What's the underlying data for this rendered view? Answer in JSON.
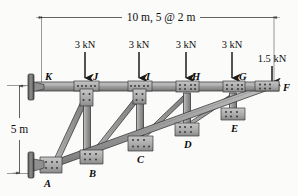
{
  "figure": {
    "type": "truss-free-body-diagram",
    "background_color": "#fbfbfa",
    "member_fill": "#9a9a9a",
    "member_stroke": "#2b2b2b",
    "gusset_fill": "#b5b5b5",
    "support_fill": "#6e6e6e"
  },
  "dimensions": {
    "span": {
      "label": "10 m, 5 @ 2 m",
      "orientation": "horizontal",
      "value_m": 10,
      "panels": 5,
      "panel_length_m": 2
    },
    "height": {
      "label": "5 m",
      "orientation": "vertical",
      "value_m": 5
    }
  },
  "loads": [
    {
      "id": "load-J",
      "label": "3 kN",
      "magnitude_kN": 3,
      "joint": "J",
      "direction": "down"
    },
    {
      "id": "load-I",
      "label": "3 kN",
      "magnitude_kN": 3,
      "joint": "I",
      "direction": "down"
    },
    {
      "id": "load-H",
      "label": "3 kN",
      "magnitude_kN": 3,
      "joint": "H",
      "direction": "down"
    },
    {
      "id": "load-G",
      "label": "3 kN",
      "magnitude_kN": 3,
      "joint": "G",
      "direction": "down"
    },
    {
      "id": "load-F",
      "label": "1.5 kN",
      "magnitude_kN": 1.5,
      "joint": "F",
      "direction": "down"
    }
  ],
  "joints": [
    {
      "id": "K",
      "label": "K",
      "chord": "top",
      "x_m": 0,
      "y_m": 5
    },
    {
      "id": "J",
      "label": "J",
      "chord": "top",
      "x_m": 2,
      "y_m": 5
    },
    {
      "id": "I",
      "label": "I",
      "chord": "top",
      "x_m": 4,
      "y_m": 5
    },
    {
      "id": "H",
      "label": "H",
      "chord": "top",
      "x_m": 6,
      "y_m": 5
    },
    {
      "id": "G",
      "label": "G",
      "chord": "top",
      "x_m": 8,
      "y_m": 5
    },
    {
      "id": "F",
      "label": "F",
      "chord": "apex",
      "x_m": 10,
      "y_m": 5
    },
    {
      "id": "A",
      "label": "A",
      "chord": "bottom",
      "x_m": 0,
      "y_m": 0
    },
    {
      "id": "B",
      "label": "B",
      "chord": "bottom",
      "x_m": 2,
      "y_m": 1
    },
    {
      "id": "C",
      "label": "C",
      "chord": "bottom",
      "x_m": 4,
      "y_m": 2
    },
    {
      "id": "D",
      "label": "D",
      "chord": "bottom",
      "x_m": 6,
      "y_m": 3
    },
    {
      "id": "E",
      "label": "E",
      "chord": "bottom",
      "x_m": 8,
      "y_m": 4
    }
  ],
  "members": [
    {
      "id": "KJ",
      "from": "K",
      "to": "J",
      "type": "top-chord"
    },
    {
      "id": "JI",
      "from": "J",
      "to": "I",
      "type": "top-chord"
    },
    {
      "id": "IH",
      "from": "I",
      "to": "H",
      "type": "top-chord"
    },
    {
      "id": "HG",
      "from": "H",
      "to": "G",
      "type": "top-chord"
    },
    {
      "id": "GF",
      "from": "G",
      "to": "F",
      "type": "top-chord"
    },
    {
      "id": "AB",
      "from": "A",
      "to": "B",
      "type": "bottom-chord"
    },
    {
      "id": "BC",
      "from": "B",
      "to": "C",
      "type": "bottom-chord"
    },
    {
      "id": "CD",
      "from": "C",
      "to": "D",
      "type": "bottom-chord"
    },
    {
      "id": "DE",
      "from": "D",
      "to": "E",
      "type": "bottom-chord"
    },
    {
      "id": "EF",
      "from": "E",
      "to": "F",
      "type": "bottom-chord"
    },
    {
      "id": "JB",
      "from": "J",
      "to": "B",
      "type": "vertical"
    },
    {
      "id": "IC",
      "from": "I",
      "to": "C",
      "type": "vertical"
    },
    {
      "id": "HD",
      "from": "H",
      "to": "D",
      "type": "vertical"
    },
    {
      "id": "GE",
      "from": "G",
      "to": "E",
      "type": "vertical"
    },
    {
      "id": "JA",
      "from": "J",
      "to": "A",
      "type": "diagonal"
    },
    {
      "id": "IB",
      "from": "I",
      "to": "B",
      "type": "diagonal"
    },
    {
      "id": "HC",
      "from": "H",
      "to": "C",
      "type": "diagonal"
    },
    {
      "id": "GD",
      "from": "G",
      "to": "E",
      "type": "diagonal"
    }
  ],
  "supports": [
    {
      "id": "support-K",
      "joint": "K",
      "kind": "wall-plate"
    },
    {
      "id": "support-A",
      "joint": "A",
      "kind": "wall-plate"
    }
  ]
}
